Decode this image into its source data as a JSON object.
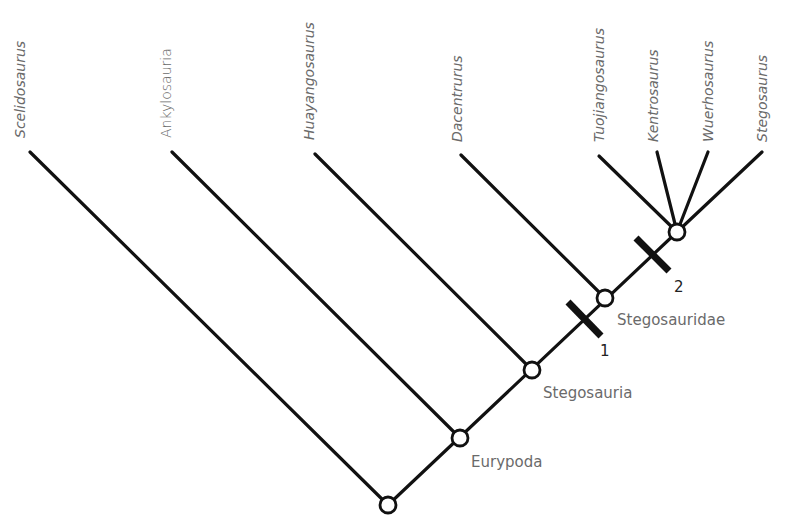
{
  "diagram": {
    "type": "cladogram",
    "taxa": [
      {
        "name": "Scelidosaurus",
        "tip": [
          30,
          152
        ],
        "label_x": 20
      },
      {
        "name": "Ankylosauria",
        "tip": [
          172,
          152
        ],
        "label_x": 179,
        "italic": false
      },
      {
        "name": "Huayangosaurus",
        "tip": [
          315,
          154
        ],
        "label_x": 318
      },
      {
        "name": "Dacentrurus",
        "tip": [
          461,
          155
        ],
        "label_x": 463
      },
      {
        "name": "Tuojiangosaurus",
        "tip": [
          599,
          156
        ],
        "label_x": 603
      },
      {
        "name": "Kentrosaurus",
        "tip": [
          657,
          152
        ],
        "label_x": 658
      },
      {
        "name": "Wuerhosaurus",
        "tip": [
          708,
          152
        ],
        "label_x": 713
      },
      {
        "name": "Stegosaurus",
        "tip": [
          762,
          152
        ],
        "label_x": 767
      }
    ],
    "nodes": [
      {
        "id": "root",
        "x": 388,
        "y": 505,
        "label": ""
      },
      {
        "id": "eurypoda",
        "x": 460,
        "y": 438,
        "label": "Eurypoda"
      },
      {
        "id": "stegosauria",
        "x": 532,
        "y": 370,
        "label": "Stegosauria"
      },
      {
        "id": "stegosauridae",
        "x": 605,
        "y": 298,
        "label": "Stegosauridae"
      },
      {
        "id": "stegosaurinae",
        "x": 677,
        "y": 232,
        "label": ""
      }
    ],
    "character_markers": [
      {
        "label": "1",
        "x": 584,
        "y": 318
      },
      {
        "label": "2",
        "x": 652,
        "y": 252
      }
    ]
  }
}
